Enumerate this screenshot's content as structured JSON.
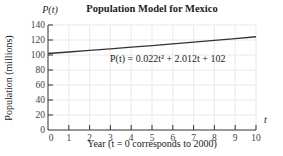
{
  "chart_data": {
    "type": "line",
    "title": "Population Model for Mexico",
    "xlabel": "Year (t = 0 corresponds to 2000)",
    "ylabel": "Population (millions)",
    "x_axis_var": "t",
    "y_axis_var": "P(t)",
    "equation": "P(t) = 0.022t² + 2.012t + 102",
    "xlim": [
      0,
      10
    ],
    "ylim": [
      0,
      140
    ],
    "x_ticks": [
      0,
      1,
      2,
      3,
      4,
      5,
      6,
      7,
      8,
      9,
      10
    ],
    "y_ticks": [
      0,
      20,
      40,
      60,
      80,
      100,
      120,
      140
    ],
    "grid": true,
    "series": [
      {
        "name": "P(t)",
        "x": [
          0,
          1,
          2,
          3,
          4,
          5,
          6,
          7,
          8,
          9,
          10
        ],
        "values": [
          102,
          104.03,
          106.11,
          108.23,
          110.4,
          112.61,
          114.86,
          117.16,
          119.5,
          121.89,
          124.32
        ]
      }
    ]
  },
  "labels": {
    "title": "Population Model for Mexico",
    "y_var": "P(t)",
    "x_var": "t",
    "ylabel": "Population (millions)",
    "xlabel": "Year (t = 0 corresponds to 2000)",
    "equation": "P(t) = 0.022t² + 2.012t + 102"
  },
  "colors": {
    "curve": "#333333",
    "grid": "#e3e3e3",
    "axis": "#333333"
  }
}
